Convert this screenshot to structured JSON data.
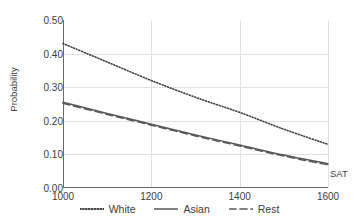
{
  "chart_data": {
    "type": "line",
    "title": "",
    "xlabel": "SAT",
    "ylabel": "Probability",
    "xlim": [
      1000,
      1600
    ],
    "ylim": [
      0.0,
      0.5
    ],
    "xticks": [
      "1000",
      "1200",
      "1400",
      "1600"
    ],
    "yticks": [
      "0.00",
      "0.10",
      "0.20",
      "0.30",
      "0.40",
      "0.50"
    ],
    "grid": "both",
    "legend_position": "bottom",
    "x": [
      1000,
      1100,
      1200,
      1300,
      1400,
      1500,
      1600
    ],
    "series": [
      {
        "name": "White",
        "style": "dotted",
        "color": "#3f3f3f",
        "values": [
          0.43,
          0.375,
          0.32,
          0.27,
          0.225,
          0.175,
          0.13
        ]
      },
      {
        "name": "Asian",
        "style": "solid",
        "color": "#595959",
        "values": [
          0.255,
          0.222,
          0.19,
          0.158,
          0.128,
          0.098,
          0.072
        ]
      },
      {
        "name": "Rest",
        "style": "dashed",
        "color": "#595959",
        "values": [
          0.252,
          0.219,
          0.187,
          0.155,
          0.125,
          0.095,
          0.069
        ]
      }
    ]
  },
  "axes": {
    "y_title": "Probability",
    "x_title": "SAT"
  },
  "legend": {
    "items": [
      {
        "label": "White"
      },
      {
        "label": "Asian"
      },
      {
        "label": "Rest"
      }
    ]
  }
}
